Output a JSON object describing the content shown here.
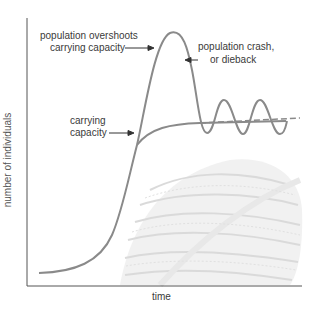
{
  "figure": {
    "type": "population growth diagram",
    "xlabel": "time",
    "ylabel": "number of individuals",
    "annotations": {
      "overshoot": [
        "population overshoots",
        "carrying capacity"
      ],
      "crash": [
        "population crash,",
        "or dieback"
      ],
      "capacity": [
        "carrying",
        "capacity"
      ]
    },
    "colors": {
      "curve": "#8a8a8a",
      "axis": "#555555",
      "background_art": "#cfcfcf"
    },
    "background_illustration": "pile-of-fish-drawing"
  }
}
